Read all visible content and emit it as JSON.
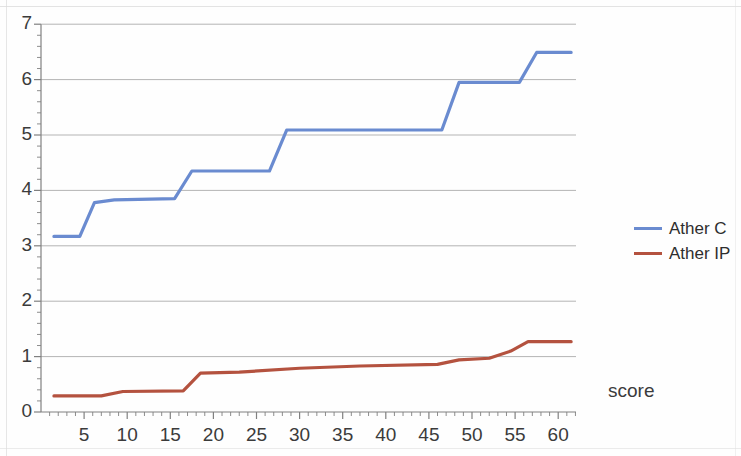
{
  "chart_data": {
    "type": "line",
    "title": "",
    "subtitle": "",
    "xlabel": "score",
    "ylabel": "",
    "xlim": [
      0,
      63
    ],
    "ylim": [
      0,
      7
    ],
    "grid": true,
    "legend_position": "right",
    "x_ticks": [
      5,
      10,
      15,
      20,
      25,
      30,
      35,
      40,
      45,
      50,
      55,
      60
    ],
    "y_ticks": [
      0,
      1,
      2,
      3,
      4,
      5,
      6,
      7
    ],
    "x_minor_tick_step": 1,
    "series": [
      {
        "name": "Ather C",
        "color": "#6a8bd0",
        "x": [
          1.5,
          4.5,
          6.2,
          8.5,
          15.5,
          17.5,
          26.5,
          28.5,
          46.5,
          48.5,
          55.5,
          57.5,
          61.5
        ],
        "values": [
          3.17,
          3.17,
          3.78,
          3.83,
          3.85,
          4.35,
          4.35,
          5.09,
          5.09,
          5.95,
          5.95,
          6.49,
          6.49
        ]
      },
      {
        "name": "Ather IP",
        "color": "#b4523f",
        "x": [
          1.5,
          7.0,
          9.5,
          16.5,
          18.5,
          23.0,
          30.0,
          37.0,
          46.0,
          48.5,
          52.0,
          54.5,
          56.5,
          61.5
        ],
        "values": [
          0.29,
          0.29,
          0.37,
          0.38,
          0.7,
          0.72,
          0.79,
          0.83,
          0.86,
          0.94,
          0.97,
          1.1,
          1.27,
          1.27
        ]
      }
    ]
  },
  "axes": {
    "y_tick_labels": [
      "7",
      "6",
      "5",
      "4",
      "3",
      "2",
      "1",
      "0"
    ],
    "x_tick_labels": [
      "5",
      "10",
      "15",
      "20",
      "25",
      "30",
      "35",
      "40",
      "45",
      "50",
      "55",
      "60"
    ],
    "x_axis_title": "score"
  },
  "legend": {
    "items": [
      {
        "label": "Ather C",
        "color": "#6a8bd0"
      },
      {
        "label": "Ather IP",
        "color": "#b4523f"
      }
    ]
  },
  "style": {
    "grid_color": "#a8a8a8",
    "axis_color": "#808080",
    "text_color": "#3b3b3b",
    "background": "#ffffff"
  }
}
